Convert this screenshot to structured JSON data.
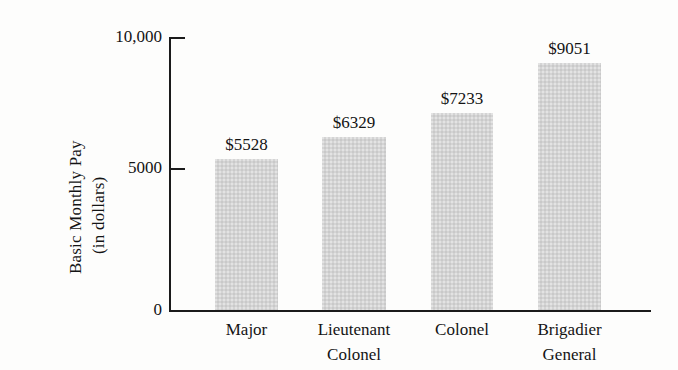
{
  "chart_data": {
    "type": "bar",
    "title": "",
    "subtitle": "",
    "xlabel": "",
    "ylabel": "Basic Monthly Pay (in dollars)",
    "ylabel_lines": [
      "Basic Monthly Pay",
      "(in dollars)"
    ],
    "categories": [
      "Major",
      "Lieutenant Colonel",
      "Colonel",
      "Brigadier General"
    ],
    "category_lines": [
      [
        "Major",
        ""
      ],
      [
        "Lieutenant",
        "Colonel"
      ],
      [
        "Colonel",
        ""
      ],
      [
        "Brigadier",
        "General"
      ]
    ],
    "values": [
      5528,
      6329,
      7233,
      9051
    ],
    "value_labels": [
      "$5528",
      "$6329",
      "$7233",
      "$9051"
    ],
    "ylim": [
      0,
      10000
    ],
    "ytick_values": [
      0,
      5000,
      10000
    ],
    "ytick_labels": [
      "0",
      "5000",
      "10,000"
    ],
    "grid": false,
    "legend": false,
    "legend_position": "none",
    "bar_color": "#d4d4d4",
    "axis_color": "#1b1b1b",
    "text_color": "#141414",
    "background_color": "#fdfdfc"
  },
  "axis": {
    "y_title_line1": "Basic Monthly Pay",
    "y_title_line2": "(in dollars)",
    "tick_10000": "10,000",
    "tick_5000": "5000",
    "tick_0": "0"
  },
  "bars": [
    {
      "category_line1": "Major",
      "category_line2": "",
      "value_label": "$5528",
      "value": 5528
    },
    {
      "category_line1": "Lieutenant",
      "category_line2": "Colonel",
      "value_label": "$6329",
      "value": 6329
    },
    {
      "category_line1": "Colonel",
      "category_line2": "",
      "value_label": "$7233",
      "value": 7233
    },
    {
      "category_line1": "Brigadier",
      "category_line2": "General",
      "value_label": "$9051",
      "value": 9051
    }
  ]
}
